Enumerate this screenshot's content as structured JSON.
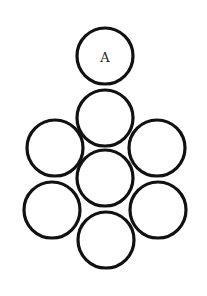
{
  "diagram": {
    "type": "circle-packing",
    "colors": {
      "stroke": "#111111",
      "fill": "#ffffff",
      "background": "#ffffff"
    },
    "radius": 28,
    "circles": [
      {
        "id": "A",
        "label": "A",
        "cx": 105,
        "cy": 56
      },
      {
        "id": "top",
        "label": "",
        "cx": 105,
        "cy": 118
      },
      {
        "id": "upper-left",
        "label": "",
        "cx": 55,
        "cy": 148
      },
      {
        "id": "upper-right",
        "label": "",
        "cx": 157,
        "cy": 148
      },
      {
        "id": "center",
        "label": "",
        "cx": 105,
        "cy": 178
      },
      {
        "id": "lower-left",
        "label": "",
        "cx": 52,
        "cy": 210
      },
      {
        "id": "lower-right",
        "label": "",
        "cx": 158,
        "cy": 210
      },
      {
        "id": "bottom",
        "label": "",
        "cx": 106,
        "cy": 240
      }
    ]
  }
}
